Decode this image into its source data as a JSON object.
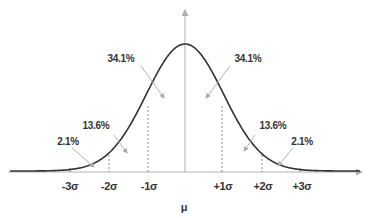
{
  "diagram": {
    "center_label": "μ",
    "colors": {
      "curve": "#333333",
      "axis": "#b0b0b0",
      "dashed": "#888888",
      "arrow": "#aaaaaa",
      "text": "#333333"
    },
    "percent_labels": {
      "left_inner": "34.1%",
      "right_inner": "34.1%",
      "left_mid": "13.6%",
      "right_mid": "13.6%",
      "left_outer": "2.1%",
      "right_outer": "2.1%"
    },
    "ticks": {
      "m3": "-3σ",
      "m2": "-2σ",
      "m1": "-1σ",
      "p1": "+1σ",
      "p2": "+2σ",
      "p3": "+3σ"
    }
  }
}
